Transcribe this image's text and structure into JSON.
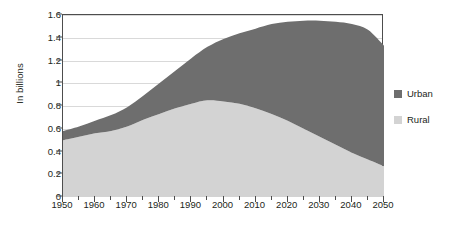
{
  "chart_data": {
    "type": "area",
    "stacked": true,
    "title": "",
    "xlabel": "",
    "ylabel": "In billions",
    "xlim": [
      1950,
      2050
    ],
    "ylim": [
      0,
      1.6
    ],
    "ytick_labels": [
      "0",
      "0.2",
      "0.4",
      "0.6",
      "0.8",
      "1",
      "1.2",
      "1.4",
      "1.6"
    ],
    "ytick_values": [
      0,
      0.2,
      0.4,
      0.6,
      0.8,
      1.0,
      1.2,
      1.4,
      1.6
    ],
    "xtick_labels": [
      "1950",
      "1960",
      "1970",
      "1980",
      "1990",
      "2000",
      "2010",
      "2020",
      "2030",
      "2040",
      "2050"
    ],
    "xtick_values": [
      1950,
      1960,
      1970,
      1980,
      1990,
      2000,
      2010,
      2020,
      2030,
      2040,
      2050
    ],
    "xminor_values": [
      1955,
      1965,
      1975,
      1985,
      1995,
      2005,
      2015,
      2025,
      2035,
      2045
    ],
    "grid": "horizontal",
    "legend_position": "right",
    "x": [
      1950,
      1955,
      1960,
      1965,
      1970,
      1975,
      1980,
      1985,
      1990,
      1995,
      2000,
      2005,
      2010,
      2015,
      2020,
      2025,
      2030,
      2035,
      2040,
      2045,
      2050
    ],
    "series": [
      {
        "name": "Rural",
        "color": "#d3d3d3",
        "values": [
          0.5,
          0.53,
          0.56,
          0.58,
          0.62,
          0.68,
          0.73,
          0.78,
          0.82,
          0.85,
          0.84,
          0.82,
          0.78,
          0.73,
          0.67,
          0.6,
          0.53,
          0.46,
          0.39,
          0.33,
          0.27
        ]
      },
      {
        "name": "Urban",
        "color": "#6e6e6e",
        "values": [
          0.08,
          0.09,
          0.11,
          0.14,
          0.17,
          0.21,
          0.27,
          0.33,
          0.4,
          0.47,
          0.55,
          0.62,
          0.7,
          0.79,
          0.87,
          0.95,
          1.02,
          1.08,
          1.13,
          1.14,
          1.06
        ]
      }
    ],
    "totals": [
      0.58,
      0.62,
      0.67,
      0.72,
      0.79,
      0.89,
      1.0,
      1.11,
      1.22,
      1.32,
      1.39,
      1.44,
      1.48,
      1.52,
      1.54,
      1.55,
      1.55,
      1.54,
      1.52,
      1.47,
      1.33
    ]
  },
  "legend": {
    "items": [
      {
        "label": "Urban",
        "color": "#6e6e6e"
      },
      {
        "label": "Rural",
        "color": "#d3d3d3"
      }
    ]
  }
}
